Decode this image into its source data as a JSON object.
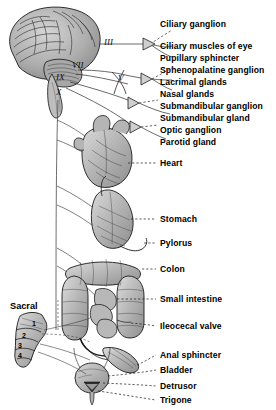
{
  "figure": {
    "background_color": "#ffffff",
    "ink_color": "#000000",
    "organ_fill": "#b9b9b9"
  },
  "cranial_nerves": [
    {
      "name": "oculomotor-iii",
      "numeral": "III",
      "x": 104,
      "y": 44
    },
    {
      "name": "facial-vii",
      "numeral": "VII",
      "x": 72,
      "y": 67
    },
    {
      "name": "trigeminal-v",
      "numeral": "V",
      "x": 118,
      "y": 80
    },
    {
      "name": "glossopharyngeal-ix",
      "numeral": "IX",
      "x": 58,
      "y": 79
    },
    {
      "name": "vagus-x",
      "numeral": "X",
      "x": 58,
      "y": 94
    }
  ],
  "sacral": {
    "label": "Sacral",
    "x": 10,
    "y": 301,
    "vertebrae": [
      "1",
      "2",
      "3",
      "4"
    ]
  },
  "labels": [
    {
      "name": "ciliary-ganglion",
      "text": "Ciliary ganglion",
      "x": 160,
      "y": 20,
      "leader": "dashed"
    },
    {
      "name": "ciliary-muscles-of-eye",
      "text": "Ciliary muscles of eye",
      "x": 160,
      "y": 42,
      "leader": "solid"
    },
    {
      "name": "pupillary-sphincter",
      "text": "Pupillary sphincter",
      "x": 160,
      "y": 54,
      "leader": "solid"
    },
    {
      "name": "sphenopalatine-ganglion",
      "text": "Sphenopalatine ganglion",
      "x": 160,
      "y": 66,
      "leader": "dashed"
    },
    {
      "name": "lacrimal-glands",
      "text": "Lacrimal glands",
      "x": 160,
      "y": 78,
      "leader": "solid"
    },
    {
      "name": "nasal-glands",
      "text": "Nasal glands",
      "x": 160,
      "y": 90,
      "leader": "solid"
    },
    {
      "name": "submandibular-ganglion",
      "text": "Submandibular ganglion",
      "x": 160,
      "y": 102,
      "leader": "dashed"
    },
    {
      "name": "submandibular-gland",
      "text": "Submandibular gland",
      "x": 160,
      "y": 114,
      "leader": "solid"
    },
    {
      "name": "optic-ganglion",
      "text": "Optic ganglion",
      "x": 160,
      "y": 126,
      "leader": "dashed"
    },
    {
      "name": "parotid-gland",
      "text": "Parotid gland",
      "x": 160,
      "y": 138,
      "leader": "solid"
    },
    {
      "name": "heart",
      "text": "Heart",
      "x": 160,
      "y": 163,
      "leader": "dashed"
    },
    {
      "name": "stomach",
      "text": "Stomach",
      "x": 160,
      "y": 219,
      "leader": "dashed"
    },
    {
      "name": "pylorus",
      "text": "Pylorus",
      "x": 160,
      "y": 243,
      "leader": "dashed"
    },
    {
      "name": "colon",
      "text": "Colon",
      "x": 160,
      "y": 269,
      "leader": "dashed"
    },
    {
      "name": "small-intestine",
      "text": "Small intestine",
      "x": 160,
      "y": 299,
      "leader": "dashed"
    },
    {
      "name": "ileocecal-valve",
      "text": "Ileocecal valve",
      "x": 160,
      "y": 326,
      "leader": "dashed"
    },
    {
      "name": "anal-sphincter",
      "text": "Anal sphincter",
      "x": 160,
      "y": 355,
      "leader": "dashed"
    },
    {
      "name": "bladder",
      "text": "Bladder",
      "x": 160,
      "y": 370,
      "leader": "dashed"
    },
    {
      "name": "detrusor",
      "text": "Detrusor",
      "x": 160,
      "y": 386,
      "leader": "dashed"
    },
    {
      "name": "trigone",
      "text": "Trigone",
      "x": 160,
      "y": 400,
      "leader": "dashed"
    }
  ],
  "organs": [
    {
      "name": "brain",
      "cx": 55,
      "cy": 45
    },
    {
      "name": "heart",
      "cx": 105,
      "cy": 160
    },
    {
      "name": "stomach",
      "cx": 108,
      "cy": 222
    },
    {
      "name": "colon",
      "cx": 100,
      "cy": 290
    },
    {
      "name": "small-intestine",
      "cx": 100,
      "cy": 305
    },
    {
      "name": "rectum",
      "cx": 108,
      "cy": 358
    },
    {
      "name": "bladder",
      "cx": 92,
      "cy": 382
    },
    {
      "name": "sacrum",
      "cx": 30,
      "cy": 350
    }
  ]
}
